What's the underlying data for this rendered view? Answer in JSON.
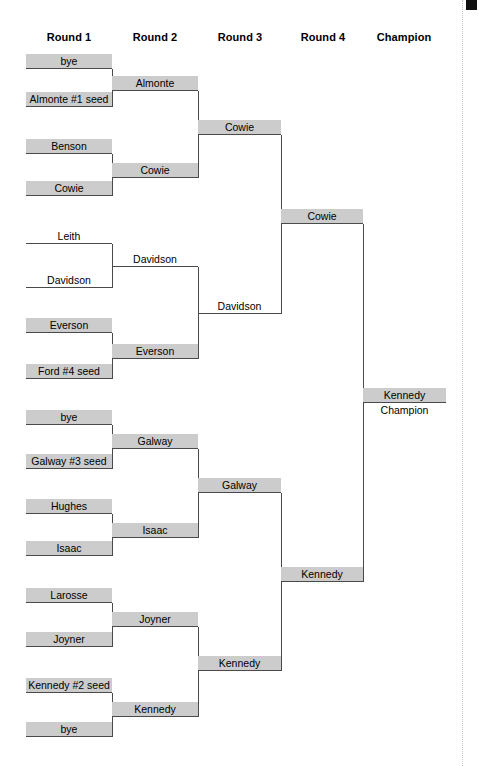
{
  "page": {
    "width": 479,
    "height": 766,
    "background": "#ffffff",
    "plate_color": "#cccccc",
    "line_color": "#4a4a4a"
  },
  "headers": [
    {
      "label": "Round 1",
      "center_x": 69
    },
    {
      "label": "Round 2",
      "center_x": 155
    },
    {
      "label": "Round 3",
      "center_x": 240
    },
    {
      "label": "Round 4",
      "center_x": 323
    },
    {
      "label": "Champion",
      "center_x": 404
    }
  ],
  "rounds": {
    "round1": {
      "label": "Round 1",
      "x": 26,
      "width": 86,
      "slots": [
        {
          "name": "bye",
          "y": 54,
          "shaded": true
        },
        {
          "name": "Almonte #1 seed",
          "y": 92,
          "shaded": true
        },
        {
          "name": "Benson",
          "y": 139,
          "shaded": true
        },
        {
          "name": "Cowie",
          "y": 181,
          "shaded": true
        },
        {
          "name": "Leith",
          "y": 229,
          "shaded": false
        },
        {
          "name": "Davidson",
          "y": 273,
          "shaded": false
        },
        {
          "name": "Everson",
          "y": 318,
          "shaded": true
        },
        {
          "name": "Ford #4 seed",
          "y": 364,
          "shaded": true
        },
        {
          "name": "bye",
          "y": 410,
          "shaded": true
        },
        {
          "name": "Galway #3 seed",
          "y": 454,
          "shaded": true
        },
        {
          "name": "Hughes",
          "y": 499,
          "shaded": true
        },
        {
          "name": "Isaac",
          "y": 541,
          "shaded": true
        },
        {
          "name": "Larosse",
          "y": 588,
          "shaded": true
        },
        {
          "name": "Joyner",
          "y": 632,
          "shaded": true
        },
        {
          "name": "Kennedy #2 seed",
          "y": 678,
          "shaded": true
        },
        {
          "name": "bye",
          "y": 722,
          "shaded": true
        }
      ]
    },
    "round2": {
      "label": "Round 2",
      "x": 112,
      "width": 86,
      "slots": [
        {
          "name": "Almonte",
          "y": 76,
          "shaded": true
        },
        {
          "name": "Cowie",
          "y": 163,
          "shaded": true
        },
        {
          "name": "Davidson",
          "y": 252,
          "shaded": false
        },
        {
          "name": "Everson",
          "y": 344,
          "shaded": true
        },
        {
          "name": "Galway",
          "y": 434,
          "shaded": true
        },
        {
          "name": "Isaac",
          "y": 523,
          "shaded": true
        },
        {
          "name": "Joyner",
          "y": 612,
          "shaded": true
        },
        {
          "name": "Kennedy",
          "y": 702,
          "shaded": true
        }
      ]
    },
    "round3": {
      "label": "Round 3",
      "x": 198,
      "width": 83,
      "slots": [
        {
          "name": "Cowie",
          "y": 120,
          "shaded": true
        },
        {
          "name": "Davidson",
          "y": 299,
          "shaded": false
        },
        {
          "name": "Galway",
          "y": 478,
          "shaded": true
        },
        {
          "name": "Kennedy",
          "y": 656,
          "shaded": true
        }
      ]
    },
    "round4": {
      "label": "Round 4",
      "x": 281,
      "width": 82,
      "slots": [
        {
          "name": "Cowie",
          "y": 209,
          "shaded": true
        },
        {
          "name": "Kennedy",
          "y": 567,
          "shaded": true
        }
      ]
    },
    "champion": {
      "label": "Champion",
      "x": 363,
      "width": 83,
      "slots": [
        {
          "name": "Kennedy",
          "y": 388,
          "shaded": true
        }
      ],
      "caption": "Champion",
      "caption_y": 404
    }
  },
  "connectors": [
    {
      "x": 112,
      "y1": 69,
      "y2": 107
    },
    {
      "x": 112,
      "y1": 154,
      "y2": 196
    },
    {
      "x": 112,
      "y1": 244,
      "y2": 288
    },
    {
      "x": 112,
      "y1": 333,
      "y2": 379
    },
    {
      "x": 112,
      "y1": 425,
      "y2": 469
    },
    {
      "x": 112,
      "y1": 514,
      "y2": 556
    },
    {
      "x": 112,
      "y1": 603,
      "y2": 647
    },
    {
      "x": 112,
      "y1": 693,
      "y2": 737
    },
    {
      "x": 198,
      "y1": 91,
      "y2": 178
    },
    {
      "x": 198,
      "y1": 267,
      "y2": 359
    },
    {
      "x": 198,
      "y1": 449,
      "y2": 538
    },
    {
      "x": 198,
      "y1": 627,
      "y2": 717
    },
    {
      "x": 281,
      "y1": 135,
      "y2": 314
    },
    {
      "x": 281,
      "y1": 493,
      "y2": 671
    },
    {
      "x": 363,
      "y1": 224,
      "y2": 582
    }
  ],
  "corner_mark": {
    "x": 466,
    "y": 0,
    "width": 11,
    "height": 10,
    "color": "#111111"
  },
  "edge_rule": {
    "x": 462
  }
}
